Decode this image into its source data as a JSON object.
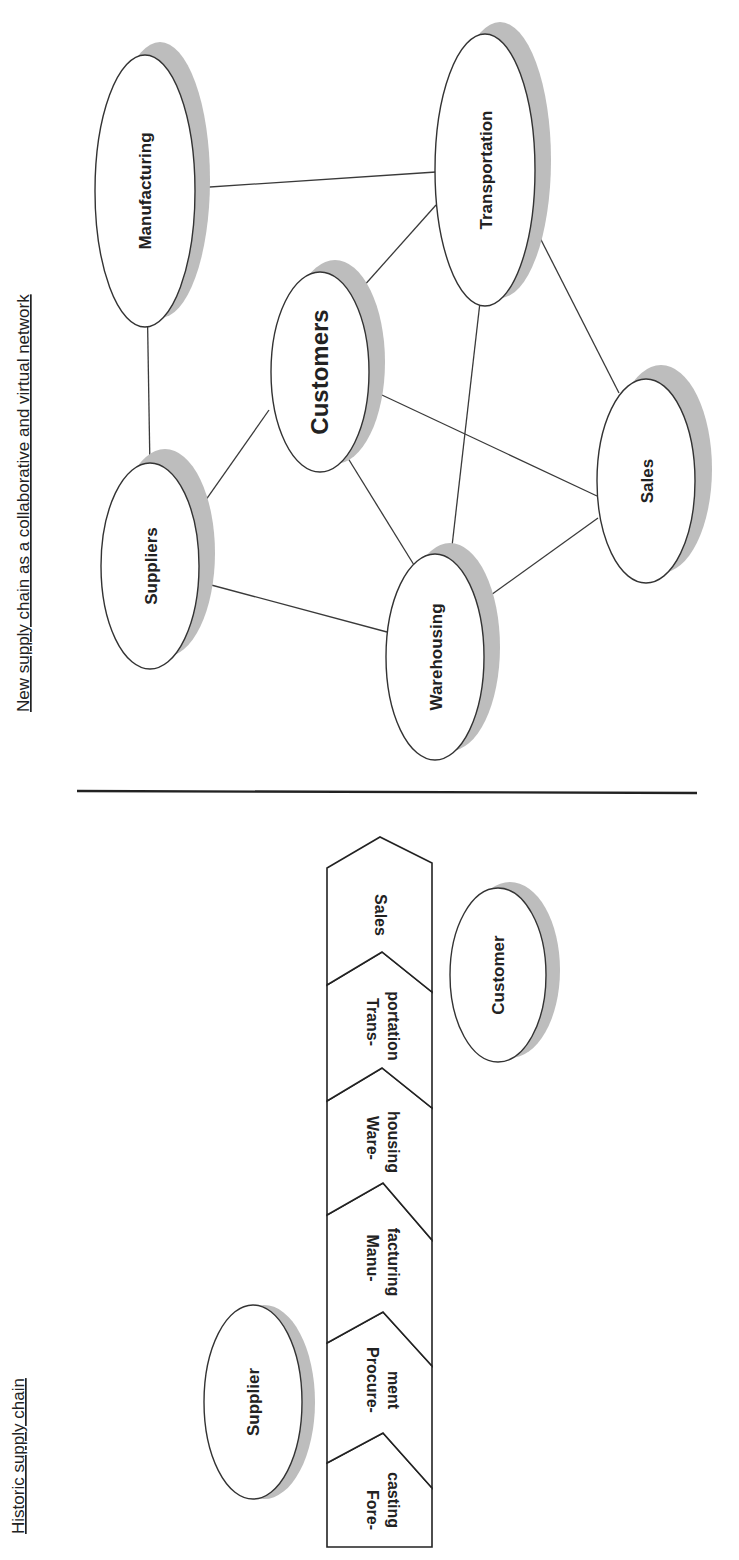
{
  "orientation": "rotated-90-ccw",
  "new_chain": {
    "title": "New supply chain as a collaborative and virtual network",
    "nodes": [
      {
        "id": "manufacturing",
        "label": "Manufacturing"
      },
      {
        "id": "transportation",
        "label": "Transportation"
      },
      {
        "id": "customers",
        "label": "Customers"
      },
      {
        "id": "suppliers",
        "label": "Suppliers"
      },
      {
        "id": "sales",
        "label": "Sales"
      },
      {
        "id": "warehousing",
        "label": "Warehousing"
      }
    ],
    "edges": [
      [
        "manufacturing",
        "transportation"
      ],
      [
        "manufacturing",
        "suppliers"
      ],
      [
        "transportation",
        "customers"
      ],
      [
        "transportation",
        "warehousing"
      ],
      [
        "transportation",
        "sales"
      ],
      [
        "customers",
        "suppliers"
      ],
      [
        "customers",
        "warehousing"
      ],
      [
        "customers",
        "sales"
      ],
      [
        "suppliers",
        "warehousing"
      ],
      [
        "warehousing",
        "sales"
      ]
    ]
  },
  "historic_chain": {
    "title": "Historic supply chain",
    "stages": [
      {
        "line1": "Fore-",
        "line2": "casting"
      },
      {
        "line1": "Procure-",
        "line2": "ment"
      },
      {
        "line1": "Manu-",
        "line2": "facturing"
      },
      {
        "line1": "Ware-",
        "line2": "housing"
      },
      {
        "line1": "Trans-",
        "line2": "portation"
      },
      {
        "line1": "Sales",
        "line2": ""
      }
    ],
    "supplier_label": "Supplier",
    "customer_label": "Customer"
  }
}
